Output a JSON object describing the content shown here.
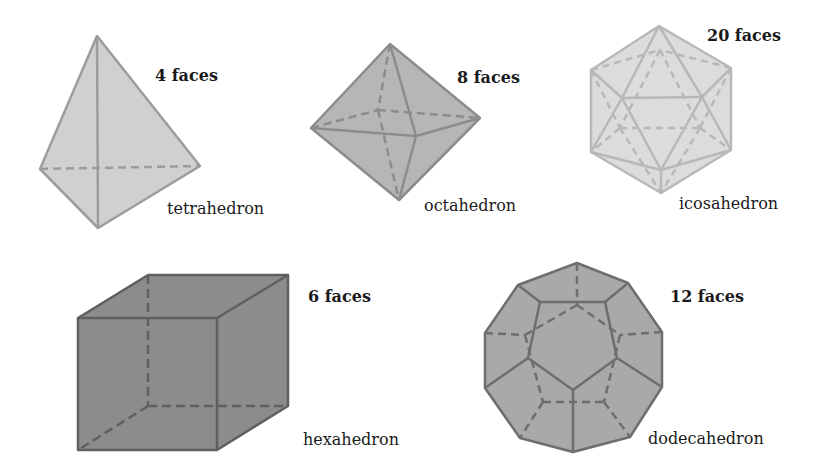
{
  "figure": {
    "solids": [
      {
        "id": "tetrahedron",
        "name": "tetrahedron",
        "faces_label": "4 faces",
        "fill": "#cfcfcf",
        "stroke": "#9a9a9a"
      },
      {
        "id": "octahedron",
        "name": "octahedron",
        "faces_label": "8 faces",
        "fill": "#b5b5b5",
        "stroke": "#8a8a8a"
      },
      {
        "id": "icosahedron",
        "name": "icosahedron",
        "faces_label": "20 faces",
        "fill": "#dadada",
        "stroke": "#b4b4b4"
      },
      {
        "id": "hexahedron",
        "name": "hexahedron",
        "faces_label": "6 faces",
        "fill": "#8c8c8c",
        "stroke": "#5e5e5e"
      },
      {
        "id": "dodecahedron",
        "name": "dodecahedron",
        "faces_label": "12 faces",
        "fill": "#a9a9a9",
        "stroke": "#6e6e6e"
      }
    ]
  }
}
